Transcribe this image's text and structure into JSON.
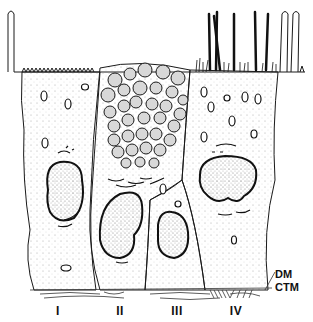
{
  "figure": {
    "cell_labels": [
      {
        "id": "I",
        "label": "I",
        "x": 58
      },
      {
        "id": "II",
        "label": "II",
        "x": 120
      },
      {
        "id": "III",
        "label": "III",
        "x": 177
      },
      {
        "id": "IV",
        "label": "IV",
        "x": 236
      }
    ],
    "layer_labels": {
      "dm": "DM",
      "ctm": "CTM"
    }
  },
  "colors": {
    "ink": "#1a1a1a",
    "granule_fill": "#d8d8d8",
    "background": "#ffffff"
  }
}
